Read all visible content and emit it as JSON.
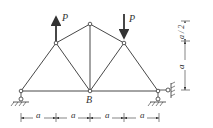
{
  "diagram": {
    "type": "truss",
    "nodes": [
      {
        "id": "left-support",
        "x": 21,
        "y": 91
      },
      {
        "id": "upper-left",
        "x": 56,
        "y": 43
      },
      {
        "id": "top",
        "x": 90,
        "y": 24
      },
      {
        "id": "upper-right",
        "x": 124,
        "y": 43
      },
      {
        "id": "right-support",
        "x": 158,
        "y": 91
      },
      {
        "id": "B",
        "x": 90,
        "y": 91
      }
    ],
    "labels": {
      "node_b": "B",
      "load_left": "P",
      "load_right": "P",
      "span_1": "a",
      "span_2": "a",
      "span_3": "a",
      "span_4": "a",
      "height_top": "a / 2",
      "height_main": "a"
    },
    "loads": [
      {
        "node": "upper-left",
        "direction": "up",
        "label": "P"
      },
      {
        "node": "upper-right",
        "direction": "down",
        "label": "P"
      }
    ],
    "supports": [
      {
        "node": "left-support",
        "type": "pin-roller-vertical"
      },
      {
        "node": "right-support",
        "type": "pin-vertical-and-horizontal"
      }
    ]
  }
}
